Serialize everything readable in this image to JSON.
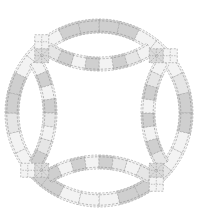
{
  "diagram": {
    "type": "quilt-block",
    "pattern_name": "",
    "canvas": {
      "width": 199,
      "height": 221,
      "background": "#ffffff"
    },
    "center": [
      99,
      113
    ],
    "outer_ring": {
      "outer_radius": 94,
      "inner_radius": 80,
      "segments": 28,
      "rotation_deg": 0
    },
    "arcs": {
      "count": 4,
      "band_width": 14,
      "center_offset": 146,
      "outer_radius": 104,
      "segments_per_arc": 8
    },
    "cornerstones": {
      "angles_deg": [
        45,
        135,
        225,
        315
      ],
      "size": 14
    },
    "colors": {
      "light": "#f3f3f3",
      "medium": "#e6e6e6",
      "dark": "#cfcfcf",
      "cornerstone": "#dadada",
      "stitch": "#8a8a8a",
      "seam": "#9a9a9a"
    },
    "outer_pattern": [
      "dark",
      "dark",
      "light",
      "light",
      "light",
      "medium",
      "dark",
      "dark",
      "light",
      "light",
      "medium",
      "dark",
      "dark",
      "light",
      "light",
      "light",
      "dark",
      "dark",
      "light",
      "light",
      "medium",
      "dark",
      "dark",
      "light",
      "light",
      "light",
      "dark",
      "dark"
    ],
    "arc_pattern": [
      "light",
      "medium",
      "dark",
      "light",
      "dark",
      "light",
      "dark",
      "medium"
    ]
  }
}
